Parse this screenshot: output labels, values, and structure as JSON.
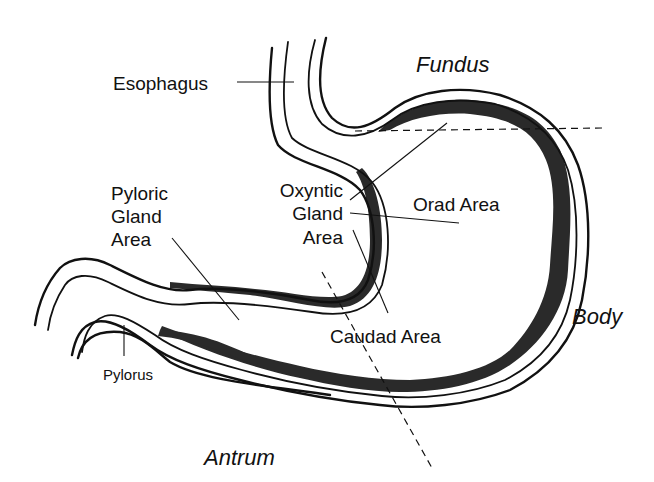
{
  "diagram": {
    "regions": {
      "fundus": "Fundus",
      "body": "Body",
      "antrum": "Antrum"
    },
    "structures": {
      "esophagus": "Esophagus",
      "pylorus": "Pylorus",
      "orad_area": "Orad Area",
      "caudad_area": "Caudad Area"
    },
    "gland_areas": {
      "pyloric": [
        "Pyloric",
        "Gland",
        "Area"
      ],
      "oxyntic": [
        "Oxyntic",
        "Gland",
        "Area"
      ]
    },
    "colors": {
      "line": "#111111",
      "mucosa": "#2a2a2a",
      "background": "#ffffff"
    }
  }
}
